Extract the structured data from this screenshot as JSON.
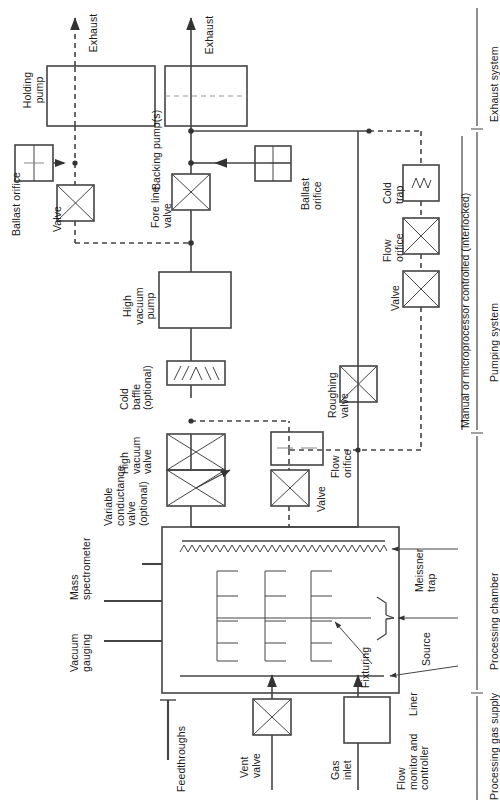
{
  "figure": {
    "orientation": "rotated-90",
    "line_color": "#444444",
    "text_color": "#1a1a1a"
  },
  "sections": [
    {
      "id": "exhaust-system",
      "label": "Exhaust system"
    },
    {
      "id": "pumping-system",
      "label": "Pumping system"
    },
    {
      "id": "processing-chamber",
      "label": "Processing chamber"
    },
    {
      "id": "processing-gas-supply",
      "label": "Processing gas supply"
    }
  ],
  "section_note": {
    "label": "Manual or microprocessor controlled (interlocked)"
  },
  "labels": {
    "exhaust_holding": "Exhaust",
    "exhaust_backing": "Exhaust",
    "holding_pump": "Holding\npump",
    "ballast_orifice_left": "Ballast orifice",
    "valve_left": "Valve",
    "backing_pump": "Backing pump(s)",
    "fore_line_valve": "Fore line\nvalve",
    "ballast_orifice_mid": "Ballast\norifice",
    "cold_trap": "Cold\ntrap",
    "flow_orifice_right": "Flow\norifice",
    "valve_right": "Valve",
    "high_vacuum_pump": "High\nvacuum\npump",
    "cold_baffle": "Cold\nbaffle\n(optional)",
    "roughing_valve": "Roughing\nvalve",
    "high_vacuum_valve": "High\nvacuum\nvalve",
    "flow_orifice_mid": "Flow\norifice",
    "variable_conductance_valve": "Variable\nconductance\nvalve\n(optional)",
    "valve_mid": "Valve",
    "mass_spectrometer": "Mass\nspectrometer",
    "vacuum_gauging": "Vacuum\ngauging",
    "meissner_trap": "Meissner\ntrap",
    "source": "Source",
    "liner": "Liner",
    "fixturing": "Fixturing",
    "feedthroughs": "Feedthroughs",
    "vent_valve": "Vent\nvalve",
    "gas_inlet": "Gas\ninlet",
    "flow_monitor": "Flow\nmonitor and\ncontroller"
  },
  "components": [
    {
      "name": "holding-pump",
      "type": "pump-box",
      "label_key": "holding_pump"
    },
    {
      "name": "backing-pump",
      "type": "pump-box-dash",
      "label_key": "backing_pump"
    },
    {
      "name": "ballast-orifice-1",
      "type": "orifice",
      "label_key": "ballast_orifice_left"
    },
    {
      "name": "ballast-orifice-2",
      "type": "orifice",
      "label_key": "ballast_orifice_mid"
    },
    {
      "name": "valve-left",
      "type": "valve-x",
      "label_key": "valve_left"
    },
    {
      "name": "fore-line-valve",
      "type": "valve-x",
      "label_key": "fore_line_valve"
    },
    {
      "name": "cold-trap",
      "type": "coldtrap",
      "label_key": "cold_trap"
    },
    {
      "name": "flow-orifice-right",
      "type": "valve-x",
      "label_key": "flow_orifice_right"
    },
    {
      "name": "valve-right",
      "type": "valve-x",
      "label_key": "valve_right"
    },
    {
      "name": "high-vacuum-pump",
      "type": "pump-box",
      "label_key": "high_vacuum_pump"
    },
    {
      "name": "cold-baffle",
      "type": "baffle",
      "label_key": "cold_baffle"
    },
    {
      "name": "high-vacuum-valve",
      "type": "valve-x",
      "label_key": "high_vacuum_valve"
    },
    {
      "name": "variable-conductance-valve",
      "type": "valve-x-adj",
      "label_key": "variable_conductance_valve"
    },
    {
      "name": "roughing-valve",
      "type": "valve-x",
      "label_key": "roughing_valve"
    },
    {
      "name": "flow-orifice-mid",
      "type": "orifice",
      "label_key": "flow_orifice_mid"
    },
    {
      "name": "valve-mid",
      "type": "valve-x",
      "label_key": "valve_mid"
    },
    {
      "name": "processing-chamber",
      "type": "chamber",
      "label_key": ""
    },
    {
      "name": "vent-valve",
      "type": "valve-x",
      "label_key": "vent_valve"
    },
    {
      "name": "flow-monitor",
      "type": "plain-box",
      "label_key": "flow_monitor"
    }
  ]
}
